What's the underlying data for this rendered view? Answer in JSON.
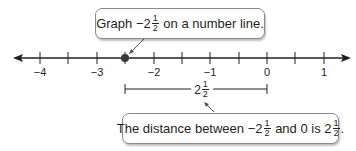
{
  "diagram": {
    "type": "number-line",
    "axis": {
      "min": -4,
      "max": 1,
      "major_step": 1,
      "minor_step": 0.5,
      "tick_labels": [
        "−4",
        "−3",
        "−2",
        "−1",
        "0",
        "1"
      ]
    },
    "point": {
      "value": -2.5,
      "label": "−2 1/2"
    },
    "distance_segment": {
      "from": -2.5,
      "to": 0,
      "whole": "2",
      "num": "1",
      "den": "2"
    },
    "top_callout": {
      "pre": "Graph ",
      "whole": "−2",
      "num": "1",
      "den": "2",
      "post": " on a number line."
    },
    "bottom_callout": {
      "pre": "The distance between ",
      "whole1": "−2",
      "num1": "1",
      "den1": "2",
      "mid": " and 0 is ",
      "whole2": "2",
      "num2": "1",
      "den2": "2",
      "post": "."
    },
    "colors": {
      "line": "#231f20",
      "point": "#3a3a3a",
      "callout_border": "#8a8a8a"
    }
  }
}
